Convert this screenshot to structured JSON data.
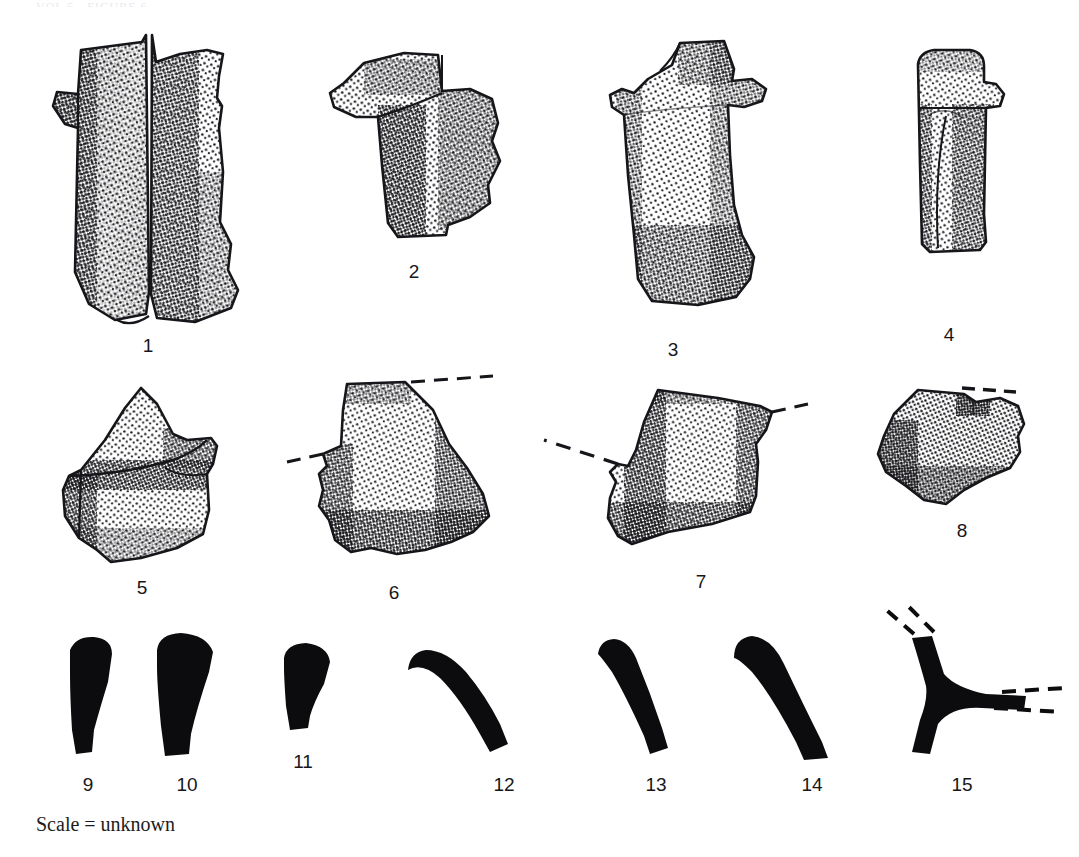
{
  "plate": {
    "background_color": "#ffffff",
    "ink_color": "#16161a",
    "width": 1079,
    "height": 857,
    "cropped_header_text": "VOL 5 - FIGURE 6",
    "caption": "Scale = unknown",
    "caption_position": {
      "x": 36,
      "y": 812
    }
  },
  "figures": [
    {
      "number": "1",
      "label_x": 148,
      "label_y": 336,
      "style": "stippled-outline",
      "description": "bone fragment, vertical shaft with lateral projection and split face",
      "has_dashed_reconstruction": false
    },
    {
      "number": "2",
      "label_x": 414,
      "label_y": 262,
      "style": "stippled-outline",
      "description": "bone fragment with hooked upper projection",
      "has_dashed_reconstruction": false
    },
    {
      "number": "3",
      "label_x": 673,
      "label_y": 340,
      "style": "stippled-outline",
      "description": "bone fragment, broad body with two lateral tabs",
      "has_dashed_reconstruction": false
    },
    {
      "number": "4",
      "label_x": 949,
      "label_y": 325,
      "style": "stippled-outline",
      "description": "narrow elongated bone fragment with small lateral knob",
      "has_dashed_reconstruction": false
    },
    {
      "number": "5",
      "label_x": 142,
      "label_y": 578,
      "style": "stippled-outline",
      "description": "blocky fragment with upswept horn-like projection",
      "has_dashed_reconstruction": false
    },
    {
      "number": "6",
      "label_x": 394,
      "label_y": 583,
      "style": "stippled-outline",
      "description": "triangular fragment with dashed reconstruction lines at upper right and left",
      "has_dashed_reconstruction": true
    },
    {
      "number": "7",
      "label_x": 701,
      "label_y": 572,
      "style": "stippled-outline",
      "description": "angular fragment with dashed reconstruction lines at left and right",
      "has_dashed_reconstruction": true
    },
    {
      "number": "8",
      "label_x": 962,
      "label_y": 521,
      "style": "stippled-outline",
      "description": "irregular flake-like fragment with dashed line along upper edge",
      "has_dashed_reconstruction": true
    },
    {
      "number": "9",
      "label_x": 88,
      "label_y": 775,
      "style": "solid-silhouette",
      "description": "tapering S-curved profile section",
      "has_dashed_reconstruction": false
    },
    {
      "number": "10",
      "label_x": 187,
      "label_y": 775,
      "style": "solid-silhouette",
      "description": "broad tapering profile section",
      "has_dashed_reconstruction": false
    },
    {
      "number": "11",
      "label_x": 303,
      "label_y": 752,
      "style": "solid-silhouette",
      "description": "short stubby profile section",
      "has_dashed_reconstruction": false
    },
    {
      "number": "12",
      "label_x": 504,
      "label_y": 775,
      "style": "solid-silhouette",
      "description": "long curved band profile section",
      "has_dashed_reconstruction": false
    },
    {
      "number": "13",
      "label_x": 656,
      "label_y": 775,
      "style": "solid-silhouette",
      "description": "slender straight profile section",
      "has_dashed_reconstruction": false
    },
    {
      "number": "14",
      "label_x": 812,
      "label_y": 775,
      "style": "solid-silhouette",
      "description": "thick elongated profile section",
      "has_dashed_reconstruction": false
    },
    {
      "number": "15",
      "label_x": 962,
      "label_y": 775,
      "style": "solid-silhouette",
      "description": "Y-shaped forked profile section with dashed extensions",
      "has_dashed_reconstruction": true
    }
  ]
}
